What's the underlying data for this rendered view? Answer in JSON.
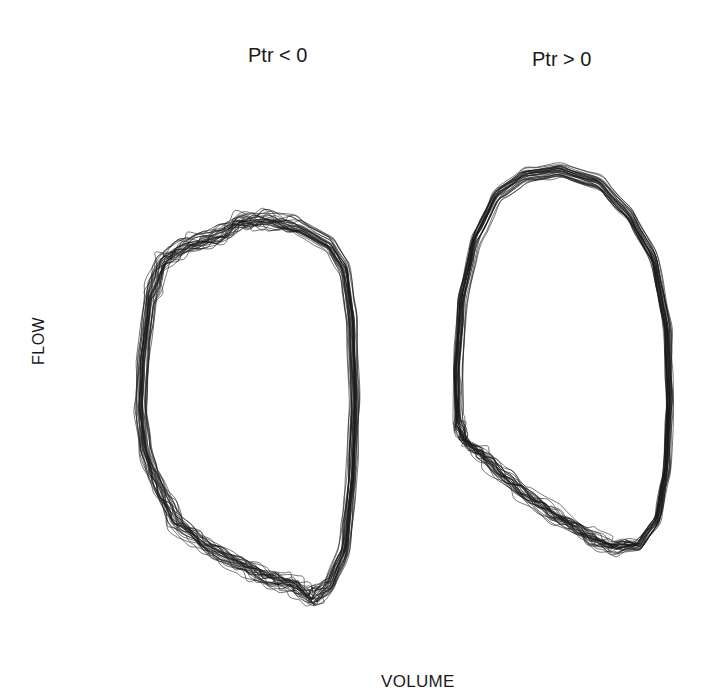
{
  "chart_data": {
    "type": "line",
    "subtype": "overlaid flow-volume loops (phase portraits)",
    "title": "",
    "xlabel": "VOLUME",
    "ylabel": "FLOW",
    "grid": false,
    "legend": null,
    "axis_ticks": "none shown",
    "panels": [
      {
        "title": "Ptr < 0",
        "n_loops_approx": 30,
        "stroke_color": "#1a1a1a",
        "description": "Overlaid closed loops, roughly D-shaped; irregular wiggles along upper-left and lower edges; near-straight right edge; sharp cusp at bottom-right",
        "pixel_bounds": {
          "x": [
            137,
            365
          ],
          "y": [
            215,
            615
          ]
        },
        "outline_points": [
          [
            345,
            270
          ],
          [
            352,
            320
          ],
          [
            355,
            400
          ],
          [
            352,
            480
          ],
          [
            345,
            550
          ],
          [
            330,
            585
          ],
          [
            312,
            598
          ],
          [
            292,
            585
          ],
          [
            270,
            578
          ],
          [
            240,
            565
          ],
          [
            205,
            545
          ],
          [
            175,
            520
          ],
          [
            155,
            480
          ],
          [
            145,
            450
          ],
          [
            141,
            410
          ],
          [
            143,
            360
          ],
          [
            150,
            300
          ],
          [
            162,
            262
          ],
          [
            185,
            245
          ],
          [
            215,
            238
          ],
          [
            240,
            222
          ],
          [
            265,
            220
          ],
          [
            300,
            228
          ],
          [
            330,
            245
          ]
        ]
      },
      {
        "title": "Ptr > 0",
        "n_loops_approx": 30,
        "stroke_color": "#1a1a1a",
        "description": "Overlaid closed loops, egg-shaped with smooth upper arc; noisy jitter cluster at lower-left; broad wiggly band along lower edge rising to the right",
        "pixel_bounds": {
          "x": [
            453,
            675
          ],
          "y": [
            163,
            570
          ]
        },
        "outline_points": [
          [
            630,
            215
          ],
          [
            655,
            260
          ],
          [
            668,
            330
          ],
          [
            670,
            400
          ],
          [
            667,
            470
          ],
          [
            658,
            520
          ],
          [
            640,
            545
          ],
          [
            615,
            548
          ],
          [
            590,
            538
          ],
          [
            555,
            515
          ],
          [
            520,
            490
          ],
          [
            490,
            462
          ],
          [
            466,
            442
          ],
          [
            458,
            420
          ],
          [
            457,
            370
          ],
          [
            462,
            300
          ],
          [
            475,
            240
          ],
          [
            497,
            195
          ],
          [
            525,
            175
          ],
          [
            560,
            170
          ],
          [
            600,
            183
          ]
        ]
      }
    ]
  }
}
